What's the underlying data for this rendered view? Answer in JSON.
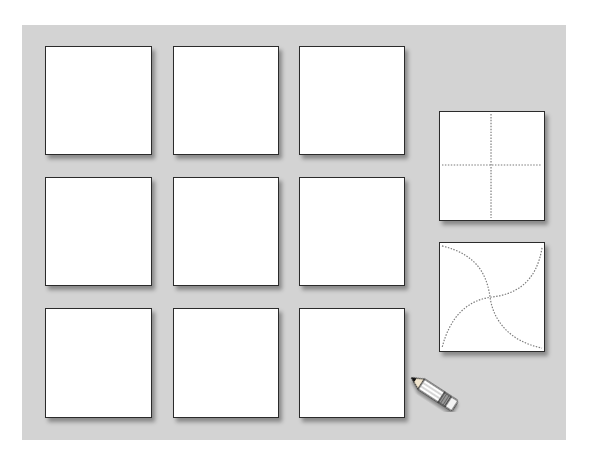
{
  "worksheet": {
    "background_color": "#d3d3d3",
    "grid": {
      "rows": 3,
      "columns": 3,
      "tiles": [
        {
          "row": 1,
          "col": 1,
          "state": "blank"
        },
        {
          "row": 1,
          "col": 2,
          "state": "blank"
        },
        {
          "row": 1,
          "col": 3,
          "state": "blank"
        },
        {
          "row": 2,
          "col": 1,
          "state": "blank"
        },
        {
          "row": 2,
          "col": 2,
          "state": "blank"
        },
        {
          "row": 2,
          "col": 3,
          "state": "blank"
        },
        {
          "row": 3,
          "col": 1,
          "state": "blank"
        },
        {
          "row": 3,
          "col": 2,
          "state": "blank"
        },
        {
          "row": 3,
          "col": 3,
          "state": "blank"
        }
      ]
    },
    "examples": [
      {
        "name": "straight-cross",
        "description": "square divided into four by dotted vertical and horizontal lines"
      },
      {
        "name": "curved-pinwheel",
        "description": "square divided by two dotted S-curves meeting at center"
      }
    ],
    "tool_icon": "pencil-icon",
    "line_color": "#7a7a7a"
  }
}
